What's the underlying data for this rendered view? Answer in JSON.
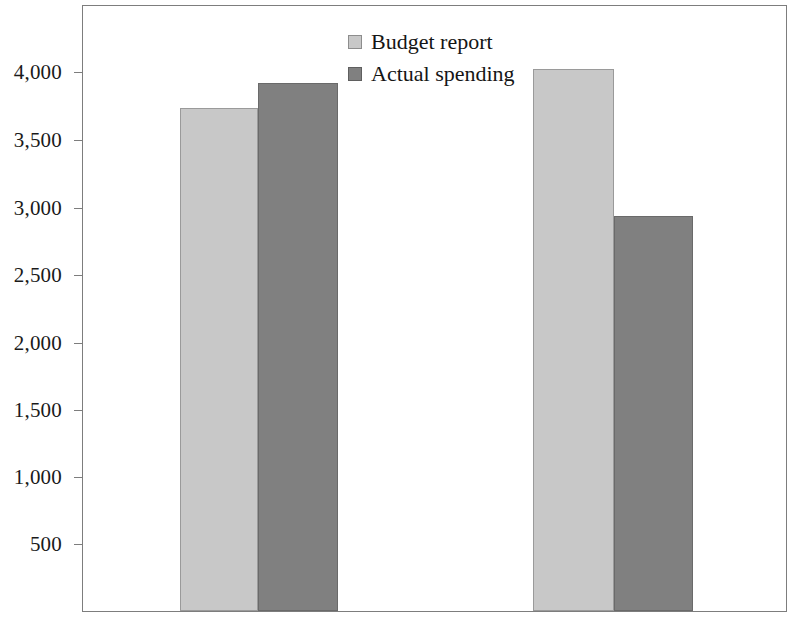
{
  "chart_data": {
    "type": "bar",
    "title": "",
    "subtitle": "",
    "xlabel": "",
    "ylabel": "",
    "categories": [
      "",
      ""
    ],
    "series": [
      {
        "name": "Budget report",
        "values": [
          3700,
          3985
        ],
        "color": "#c8c8c8"
      },
      {
        "name": "Actual spending",
        "values": [
          3880,
          2905
        ],
        "color": "#808080"
      }
    ],
    "ylim": [
      0,
      4250
    ],
    "yticks": [
      500,
      1000,
      1500,
      2000,
      2500,
      3000,
      3500,
      4000
    ],
    "ytick_labels": [
      "500",
      "1,000",
      "1,500",
      "2,000",
      "2,500",
      "3,000",
      "3,500",
      "4,000"
    ],
    "grid": false,
    "legend_position": "top-center"
  },
  "legend": {
    "items": [
      {
        "label": "Budget report",
        "swatch": "light-gray-swatch"
      },
      {
        "label": "Actual spending",
        "swatch": "dark-gray-swatch"
      }
    ]
  },
  "axis": {
    "y_tick_labels": [
      "4,000",
      "3,500",
      "3,000",
      "2,500",
      "2,000",
      "1,500",
      "1,000",
      "500"
    ]
  },
  "colors": {
    "budget_report": "#c8c8c8",
    "actual_spending": "#808080",
    "frame": "#7d7d7d",
    "text": "#1a1a1a",
    "background": "#ffffff"
  }
}
